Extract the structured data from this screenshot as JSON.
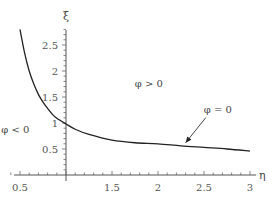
{
  "chart_data": {
    "type": "line",
    "title": "",
    "xlabel": "η",
    "ylabel": "ξ",
    "xlim": [
      0.5,
      3.1
    ],
    "ylim": [
      0,
      2.9
    ],
    "grid": false,
    "xticks": [
      0.5,
      1,
      1.5,
      2,
      2.5,
      3
    ],
    "xtick_labels": [
      "0.5",
      "",
      "1.5",
      "2",
      "2.5",
      "3"
    ],
    "yticks": [
      0.5,
      1,
      1.5,
      2,
      2.5
    ],
    "ytick_labels": [
      "0.5",
      "1",
      "1.5",
      "2",
      "2.5"
    ],
    "values_are_estimates": true,
    "series": [
      {
        "name": "φ = 0",
        "x": [
          0.5,
          0.55,
          0.6,
          0.65,
          0.7,
          0.75,
          0.8,
          0.85,
          0.9,
          1.0,
          1.1,
          1.25,
          1.5,
          1.75,
          2.0,
          2.25,
          2.5,
          2.75,
          3.0
        ],
        "y": [
          2.8,
          2.35,
          2.0,
          1.75,
          1.55,
          1.4,
          1.28,
          1.17,
          1.09,
          0.98,
          0.88,
          0.78,
          0.67,
          0.62,
          0.6,
          0.56,
          0.53,
          0.5,
          0.46
        ]
      }
    ],
    "annotations": [
      {
        "text": "φ < 0",
        "x": 0.45,
        "y": 0.8
      },
      {
        "text": "φ > 0",
        "x": 1.9,
        "y": 1.7
      },
      {
        "text": "φ = 0",
        "x": 2.65,
        "y": 1.2,
        "arrow_to": [
          2.3,
          0.6
        ]
      }
    ]
  }
}
